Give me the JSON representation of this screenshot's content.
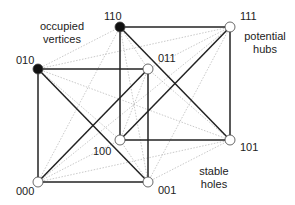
{
  "diagram": {
    "type": "hypercube-graph",
    "nodes": [
      {
        "id": "110",
        "label": "110",
        "x": 120,
        "y": 27,
        "filled": true,
        "lx": 104,
        "ly": 20
      },
      {
        "id": "111",
        "label": "111",
        "x": 230,
        "y": 27,
        "filled": false,
        "lx": 240,
        "ly": 20
      },
      {
        "id": "010",
        "label": "010",
        "x": 38,
        "y": 69,
        "filled": true,
        "lx": 16,
        "ly": 64
      },
      {
        "id": "011",
        "label": "011",
        "x": 148,
        "y": 69,
        "filled": false,
        "lx": 158,
        "ly": 62
      },
      {
        "id": "100",
        "label": "100",
        "x": 120,
        "y": 140,
        "filled": false,
        "lx": 93,
        "ly": 155
      },
      {
        "id": "101",
        "label": "101",
        "x": 230,
        "y": 140,
        "filled": false,
        "lx": 240,
        "ly": 151
      },
      {
        "id": "000",
        "label": "000",
        "x": 38,
        "y": 182,
        "filled": false,
        "lx": 16,
        "ly": 195
      },
      {
        "id": "001",
        "label": "001",
        "x": 148,
        "y": 182,
        "filled": false,
        "lx": 158,
        "ly": 194
      }
    ],
    "solid_edges": [
      [
        "010",
        "011"
      ],
      [
        "011",
        "001"
      ],
      [
        "001",
        "000"
      ],
      [
        "000",
        "010"
      ],
      [
        "010",
        "001"
      ],
      [
        "000",
        "011"
      ],
      [
        "110",
        "111"
      ],
      [
        "111",
        "101"
      ],
      [
        "101",
        "100"
      ],
      [
        "100",
        "110"
      ],
      [
        "110",
        "101"
      ],
      [
        "100",
        "111"
      ]
    ],
    "dotted_edges": [
      [
        "010",
        "110"
      ],
      [
        "010",
        "111"
      ],
      [
        "010",
        "100"
      ],
      [
        "010",
        "101"
      ],
      [
        "011",
        "110"
      ],
      [
        "011",
        "111"
      ],
      [
        "011",
        "100"
      ],
      [
        "011",
        "101"
      ],
      [
        "000",
        "110"
      ],
      [
        "000",
        "111"
      ],
      [
        "000",
        "100"
      ],
      [
        "000",
        "101"
      ],
      [
        "001",
        "110"
      ],
      [
        "001",
        "111"
      ],
      [
        "001",
        "100"
      ],
      [
        "001",
        "101"
      ]
    ],
    "annotations": [
      {
        "id": "occupied",
        "lines": [
          "occupied",
          "vertices"
        ],
        "x": 62,
        "y": 30
      },
      {
        "id": "hubs",
        "lines": [
          "potential",
          "hubs"
        ],
        "x": 265,
        "y": 40
      },
      {
        "id": "holes",
        "lines": [
          "stable",
          "holes"
        ],
        "x": 214,
        "y": 175
      }
    ],
    "colors": {
      "solid": "#222222",
      "dotted": "#bbbbbb",
      "filled_node": "#111111",
      "open_node": "#ffffff"
    }
  }
}
